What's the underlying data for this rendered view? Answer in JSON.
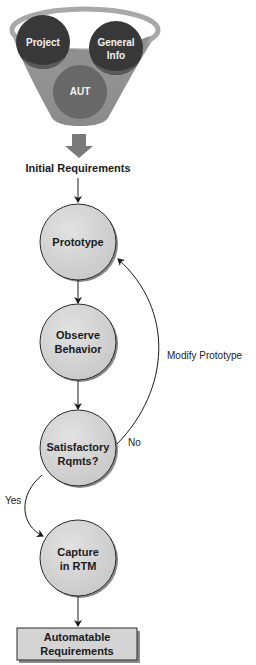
{
  "funnel": {
    "inputs": [
      {
        "id": "project",
        "label": "Project"
      },
      {
        "id": "general-info",
        "label_line1": "General",
        "label_line2": "Info"
      },
      {
        "id": "aut",
        "label": "AUT"
      }
    ],
    "colors": {
      "funnel_body": "#8f8f8f",
      "funnel_rim": "#a8a8a8",
      "input_circles": "#3a3a3a",
      "aut_circle": "#6a6a6a",
      "down_arrow": "#7a7a7a"
    }
  },
  "initial_requirements": {
    "label": "Initial Requirements"
  },
  "nodes": {
    "prototype": {
      "label": "Prototype"
    },
    "observe_behavior": {
      "line1": "Observe",
      "line2": "Behavior"
    },
    "satisfactory_rqmts": {
      "line1": "Satisfactory",
      "line2": "Rqmts?"
    },
    "capture_rtm": {
      "line1": "Capture",
      "line2": "in RTM"
    },
    "automatable_requirements": {
      "line1": "Automatable",
      "line2": "Requirements"
    }
  },
  "edges": {
    "modify_prototype": {
      "label": "Modify Prototype"
    },
    "no": {
      "label": "No"
    },
    "yes": {
      "label": "Yes"
    }
  },
  "colors": {
    "node_fill": "#d4d4d4",
    "node_stroke": "#2a2a2a",
    "node_shadow": "#8a8a8a",
    "line": "#1a1a1a"
  }
}
